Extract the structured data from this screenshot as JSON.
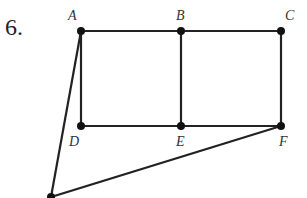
{
  "problem_number": "6.",
  "labels": {
    "A": "A",
    "B": "B",
    "C": "C",
    "D": "D",
    "E": "E",
    "F": "F"
  },
  "vertices": {
    "A": [
      81,
      31
    ],
    "B": [
      181,
      31
    ],
    "C": [
      281,
      31
    ],
    "D": [
      81,
      126
    ],
    "E": [
      181,
      126
    ],
    "F": [
      281,
      126
    ],
    "G": [
      51,
      197
    ]
  },
  "edges": [
    [
      "A",
      "B"
    ],
    [
      "B",
      "C"
    ],
    [
      "A",
      "D"
    ],
    [
      "B",
      "E"
    ],
    [
      "C",
      "F"
    ],
    [
      "D",
      "E"
    ],
    [
      "E",
      "F"
    ],
    [
      "A",
      "G"
    ],
    [
      "G",
      "F"
    ]
  ],
  "colors": {
    "stroke": "#222222",
    "label": "#333333"
  }
}
